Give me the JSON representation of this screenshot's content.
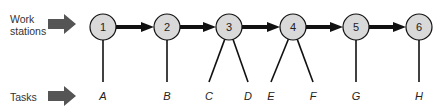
{
  "labels": {
    "stations": "Work\nstations",
    "stations_line1": "Work",
    "stations_line2": "stations",
    "tasks": "Tasks"
  },
  "colors": {
    "node_fill": "#d9d9d9",
    "stroke": "#111111",
    "block_arrow": "#555555"
  },
  "stations": [
    {
      "id": "1",
      "x": 103,
      "tasks": [
        "A"
      ]
    },
    {
      "id": "2",
      "x": 167,
      "tasks": [
        "B"
      ]
    },
    {
      "id": "3",
      "x": 229,
      "tasks": [
        "C",
        "D"
      ]
    },
    {
      "id": "4",
      "x": 293,
      "tasks": [
        "E",
        "F"
      ]
    },
    {
      "id": "5",
      "x": 356,
      "tasks": [
        "G"
      ]
    },
    {
      "id": "6",
      "x": 419,
      "tasks": [
        "H"
      ]
    }
  ],
  "tasks": [
    {
      "label": "A",
      "x": 103
    },
    {
      "label": "B",
      "x": 167
    },
    {
      "label": "C",
      "x": 209
    },
    {
      "label": "D",
      "x": 248
    },
    {
      "label": "E",
      "x": 271
    },
    {
      "label": "F",
      "x": 313
    },
    {
      "label": "G",
      "x": 356
    },
    {
      "label": "H",
      "x": 419
    }
  ]
}
